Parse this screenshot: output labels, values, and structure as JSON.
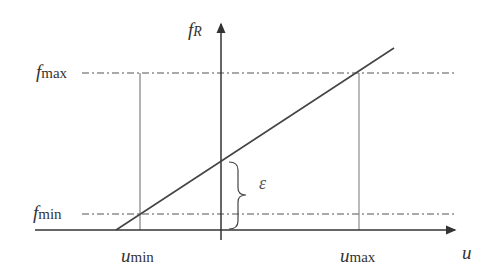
{
  "diagram": {
    "axes": {
      "vertical_label": "f",
      "vertical_label_sub": "R",
      "horizontal_label": "u"
    },
    "levels": {
      "f_max": {
        "symbol": "f",
        "sub": "max"
      },
      "f_min": {
        "symbol": "f",
        "sub": "min"
      }
    },
    "inputs": {
      "u_min": {
        "symbol": "u",
        "sub": "min"
      },
      "u_max": {
        "symbol": "u",
        "sub": "max"
      }
    },
    "offset_label": "ε",
    "colors": {
      "line": "#444444",
      "dash": "#555555",
      "text": "#333333"
    }
  }
}
